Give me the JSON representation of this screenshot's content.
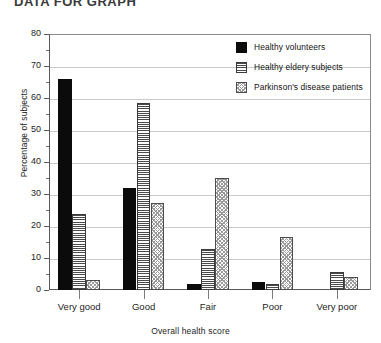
{
  "caption_fragment": "DATA FOR GRAPH",
  "chart_data": {
    "type": "bar",
    "title": "",
    "xlabel": "Overall health score",
    "ylabel": "Percentage of subjects",
    "ylim": [
      0,
      80
    ],
    "ytick_step": 10,
    "yminor_step": 5,
    "grid": true,
    "grid_axis": "y",
    "legend_position": "top-right",
    "categories": [
      "Very good",
      "Good",
      "Fair",
      "Poor",
      "Very poor"
    ],
    "ytick_labels": [
      "0",
      "10",
      "20",
      "30",
      "40",
      "50",
      "60",
      "70",
      "80"
    ],
    "series": [
      {
        "name": "Healthy volunteers",
        "pattern": "solid",
        "color": "#0b0b0b",
        "values": [
          66,
          31.8,
          2,
          2.4,
          0
        ]
      },
      {
        "name": "Healthy eldery subjects",
        "pattern": "horizontal-lines",
        "color": "#4a4a4a",
        "values": [
          23.6,
          58.4,
          12.7,
          1.9,
          5.7
        ]
      },
      {
        "name": "Parkinson's disease patients",
        "pattern": "checker",
        "color": "#9a9a9a",
        "values": [
          3.2,
          27.2,
          34.9,
          16.7,
          4.0
        ]
      }
    ]
  },
  "legend": {
    "entries": [
      {
        "label": "Healthy volunteers"
      },
      {
        "label": "Healthy eldery subjects"
      },
      {
        "label": "Parkinson's disease patients"
      }
    ]
  },
  "axes": {
    "y_title": "Percentage of subjects",
    "x_title": "Overall health score"
  }
}
